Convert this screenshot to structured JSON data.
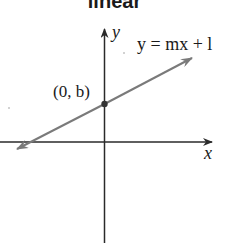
{
  "title": "linear",
  "diagram": {
    "type": "coordinate-graph",
    "x_axis_label": "x",
    "y_axis_label": "y",
    "equation_label": "y = mx + b",
    "equation_visible_text": "y = mx + l",
    "intercept_label": "(0, b)",
    "colors": {
      "axes": "#2a2a2a",
      "line": "#7a7a7a",
      "point": "#333333",
      "text": "#1a1a1a"
    }
  }
}
